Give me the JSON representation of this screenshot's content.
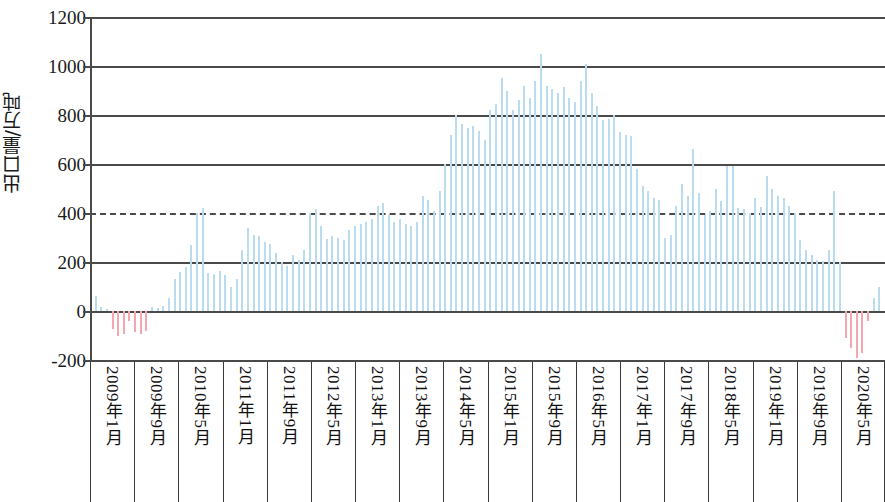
{
  "chart": {
    "type": "bar",
    "ylabel": "出口量/万吨",
    "xlabel": "",
    "title": "",
    "ylim": [
      -200,
      1200
    ],
    "ytick_step": 200,
    "yticks": [
      "1200",
      "1000",
      "800",
      "600",
      "400",
      "200",
      "0",
      "-200"
    ],
    "grid": "horizontal",
    "legend": "none",
    "colors": {
      "positive_bar": "#b9dcee",
      "negative_bar": "#f5a7b0",
      "axis": "#4a4a4a",
      "text": "#111111"
    },
    "x_cell_labels": [
      "2009年1月",
      "2009年9月",
      "2010年5月",
      "2011年1月",
      "2011年9月",
      "2012年5月",
      "2013年1月",
      "2013年9月",
      "2014年5月",
      "2015年1月",
      "2015年9月",
      "2016年5月",
      "2017年1月",
      "2017年9月",
      "2018年5月",
      "2019年1月",
      "2019年9月",
      "2020年5月"
    ],
    "x_cell_positions": [
      0,
      1,
      2,
      3,
      4,
      5,
      6,
      7,
      8,
      9,
      10,
      11,
      12,
      13,
      14,
      15,
      16,
      17
    ]
  },
  "chart_data": {
    "type": "bar",
    "title": "",
    "xlabel": "",
    "ylabel": "出口量/万吨",
    "ylim": [
      -200,
      1200
    ],
    "ytick_step": 200,
    "grid": "horizontal gridlines at every 200 units",
    "legend": "none",
    "x_start": "2009年1月",
    "x_end": "2020年8月",
    "x_tick_labels": [
      "2009年1月",
      "2009年9月",
      "2010年5月",
      "2011年1月",
      "2011年9月",
      "2012年5月",
      "2013年1月",
      "2013年9月",
      "2014年5月",
      "2015年1月",
      "2015年9月",
      "2016年5月",
      "2017年1月",
      "2017年9月",
      "2018年5月",
      "2019年1月",
      "2019年9月",
      "2020年5月"
    ],
    "x_tick_interval_months": 8,
    "categories": [
      "2009-01",
      "2009-02",
      "2009-03",
      "2009-04",
      "2009-05",
      "2009-06",
      "2009-07",
      "2009-08",
      "2009-09",
      "2009-10",
      "2009-11",
      "2009-12",
      "2010-01",
      "2010-02",
      "2010-03",
      "2010-04",
      "2010-05",
      "2010-06",
      "2010-07",
      "2010-08",
      "2010-09",
      "2010-10",
      "2010-11",
      "2010-12",
      "2011-01",
      "2011-02",
      "2011-03",
      "2011-04",
      "2011-05",
      "2011-06",
      "2011-07",
      "2011-08",
      "2011-09",
      "2011-10",
      "2011-11",
      "2011-12",
      "2012-01",
      "2012-02",
      "2012-03",
      "2012-04",
      "2012-05",
      "2012-06",
      "2012-07",
      "2012-08",
      "2012-09",
      "2012-10",
      "2012-11",
      "2012-12",
      "2013-01",
      "2013-02",
      "2013-03",
      "2013-04",
      "2013-05",
      "2013-06",
      "2013-07",
      "2013-08",
      "2013-09",
      "2013-10",
      "2013-11",
      "2013-12",
      "2014-01",
      "2014-02",
      "2014-03",
      "2014-04",
      "2014-05",
      "2014-06",
      "2014-07",
      "2014-08",
      "2014-09",
      "2014-10",
      "2014-11",
      "2014-12",
      "2015-01",
      "2015-02",
      "2015-03",
      "2015-04",
      "2015-05",
      "2015-06",
      "2015-07",
      "2015-08",
      "2015-09",
      "2015-10",
      "2015-11",
      "2015-12",
      "2016-01",
      "2016-02",
      "2016-03",
      "2016-04",
      "2016-05",
      "2016-06",
      "2016-07",
      "2016-08",
      "2016-09",
      "2016-10",
      "2016-11",
      "2016-12",
      "2017-01",
      "2017-02",
      "2017-03",
      "2017-04",
      "2017-05",
      "2017-06",
      "2017-07",
      "2017-08",
      "2017-09",
      "2017-10",
      "2017-11",
      "2017-12",
      "2018-01",
      "2018-02",
      "2018-03",
      "2018-04",
      "2018-05",
      "2018-06",
      "2018-07",
      "2018-08",
      "2018-09",
      "2018-10",
      "2018-11",
      "2018-12",
      "2019-01",
      "2019-02",
      "2019-03",
      "2019-04",
      "2019-05",
      "2019-06",
      "2019-07",
      "2019-08",
      "2019-09",
      "2019-10",
      "2019-11",
      "2019-12",
      "2020-01",
      "2020-02",
      "2020-03",
      "2020-04",
      "2020-05",
      "2020-06",
      "2020-07",
      "2020-08"
    ],
    "values": [
      60,
      15,
      10,
      -75,
      -100,
      -95,
      -40,
      -85,
      -95,
      -80,
      15,
      12,
      20,
      55,
      130,
      160,
      180,
      270,
      400,
      420,
      155,
      150,
      165,
      145,
      100,
      130,
      250,
      340,
      310,
      305,
      280,
      275,
      235,
      200,
      185,
      230,
      210,
      250,
      400,
      415,
      345,
      295,
      305,
      300,
      290,
      330,
      345,
      355,
      365,
      375,
      430,
      440,
      390,
      365,
      375,
      355,
      345,
      365,
      470,
      455,
      410,
      490,
      600,
      720,
      800,
      765,
      745,
      755,
      735,
      700,
      820,
      845,
      950,
      900,
      820,
      860,
      920,
      870,
      940,
      1050,
      920,
      905,
      890,
      915,
      870,
      855,
      940,
      1010,
      890,
      835,
      780,
      785,
      800,
      730,
      720,
      715,
      580,
      510,
      490,
      460,
      455,
      300,
      310,
      430,
      520,
      470,
      660,
      480,
      390,
      410,
      500,
      450,
      590,
      590,
      420,
      415,
      400,
      460,
      425,
      550,
      500,
      470,
      460,
      430,
      400,
      290,
      250,
      230,
      210,
      205,
      250,
      490,
      200,
      -110,
      -150,
      -190,
      -170,
      -40,
      55,
      100
    ],
    "series_color": "#b9dcee",
    "negative_color": "#f5a7b0"
  }
}
